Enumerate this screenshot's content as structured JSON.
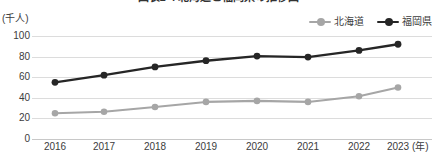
{
  "title": "図表1-4 北海道と福岡県の推移図",
  "axes": {
    "y_unit_label": "(千人)",
    "x_unit_label": "(年)",
    "y_ticks": [
      "100",
      "80",
      "60",
      "40",
      "20",
      "0"
    ],
    "x_ticks": [
      "2016",
      "2017",
      "2018",
      "2019",
      "2020",
      "2021",
      "2022",
      "2023"
    ]
  },
  "legend": {
    "items": [
      {
        "label": "北海道",
        "color": "#a6a6a6"
      },
      {
        "label": "福岡県",
        "color": "#262626"
      }
    ]
  },
  "chart_data": {
    "type": "line",
    "title": "図表1-4 北海道と福岡県の推移図",
    "xlabel": "(年)",
    "ylabel": "(千人)",
    "ylim": [
      0,
      100
    ],
    "yticks": [
      0,
      20,
      40,
      60,
      80,
      100
    ],
    "grid": true,
    "legend_position": "top-right",
    "categories": [
      "2016",
      "2017",
      "2018",
      "2019",
      "2020",
      "2021",
      "2022",
      "2023"
    ],
    "series": [
      {
        "name": "北海道",
        "color": "#a6a6a6",
        "values": [
          25,
          26.5,
          31,
          36,
          37,
          36,
          41.5,
          50
        ]
      },
      {
        "name": "福岡県",
        "color": "#262626",
        "values": [
          55,
          62,
          70,
          76,
          80.5,
          79.5,
          86,
          92
        ]
      }
    ]
  }
}
